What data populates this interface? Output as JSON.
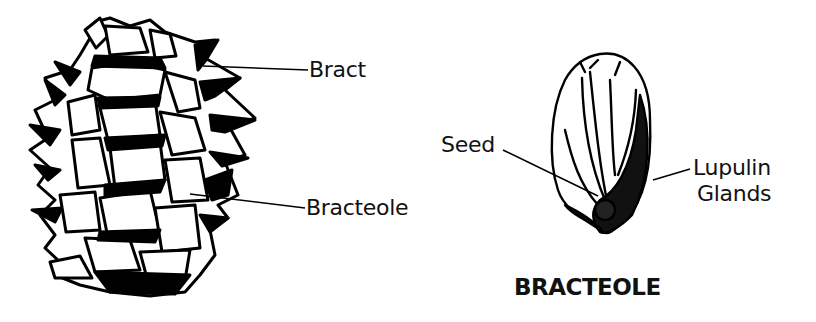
{
  "diagram": {
    "labels": {
      "bract": "Bract",
      "bracteole": "Bracteole",
      "seed": "Seed",
      "lupulin_line1": "Lupulin",
      "lupulin_line2": "Glands"
    },
    "caption": "BRACTEOLE"
  }
}
